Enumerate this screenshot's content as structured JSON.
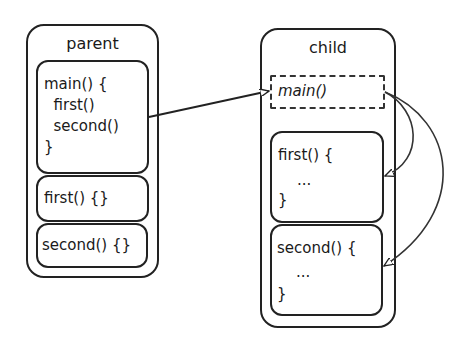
{
  "parent": {
    "title": "parent",
    "main_block": [
      "main() {",
      "  first()",
      "  second()",
      "}"
    ],
    "first_block": "first() {}",
    "second_block": "second() {}"
  },
  "child": {
    "title": "child",
    "main_stub": "main()",
    "first_block": [
      "first() {",
      "    ...",
      "}"
    ],
    "second_block": [
      "second() {",
      "    ...",
      "}"
    ]
  },
  "arrows": [
    {
      "from": "parent.main",
      "to": "child.main"
    },
    {
      "from": "child.main",
      "to": "child.first"
    },
    {
      "from": "child.main",
      "to": "child.second"
    }
  ]
}
